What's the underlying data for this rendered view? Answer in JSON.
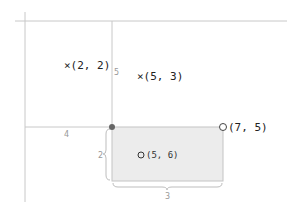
{
  "diagram": {
    "colors": {
      "axis": "#c8c8c8",
      "rect_fill": "#ececec",
      "rect_stroke": "#c4c4c4",
      "dot": "#666666",
      "brace": "#bdbdbd",
      "text": "#222222",
      "dim_text": "#999999"
    },
    "points": [
      {
        "id": "p1",
        "marker": "cross",
        "label": "×(2, 2)"
      },
      {
        "id": "p2",
        "marker": "cross",
        "label": "×(5, 3)"
      },
      {
        "id": "p3",
        "marker": "circle",
        "label": "(5, 6)"
      },
      {
        "id": "p4",
        "marker": "circle",
        "label": "(7, 5)"
      }
    ],
    "dimensions": {
      "vertical_segment": "5",
      "horizontal_segment": "4",
      "rect_height": "2",
      "rect_width": "3"
    }
  }
}
